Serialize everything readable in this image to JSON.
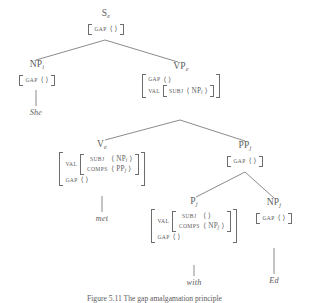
{
  "figure": {
    "caption": "Figure 5.11  The gap amalgamation principle"
  },
  "symbols": {
    "empty_list": "⟨ ⟩",
    "angle_open": "⟨",
    "angle_close": "⟩"
  },
  "tree": {
    "nodes": {
      "s": {
        "label": "S",
        "index": "e",
        "avm": {
          "rows": [
            {
              "attr": "GAP",
              "value": "⟨ ⟩"
            }
          ]
        }
      },
      "np_subject": {
        "label": "NP",
        "index": "i",
        "avm": {
          "rows": [
            {
              "attr": "GAP",
              "value": "⟨ ⟩"
            }
          ]
        },
        "word": "She"
      },
      "vp": {
        "label": "VP",
        "index": "e",
        "avm": {
          "rows": [
            {
              "attr": "GAP",
              "value": "⟨ ⟩"
            },
            {
              "attr": "VAL",
              "nested_rows": [
                {
                  "attr": "SUBJ",
                  "value": "⟨ NP",
                  "sub": "i",
                  "value_tail": " ⟩"
                }
              ]
            }
          ]
        }
      },
      "v": {
        "label": "V",
        "index": "e",
        "avm": {
          "rows": [
            {
              "attr": "VAL",
              "nested_rows": [
                {
                  "attr": "SUBJ",
                  "value": "⟨ NP",
                  "sub": "i",
                  "value_tail": " ⟩"
                },
                {
                  "attr": "COMPS",
                  "value": "⟨ PP",
                  "sub": "j",
                  "value_tail": " ⟩"
                }
              ]
            },
            {
              "attr": "GAP",
              "value": "⟨ ⟩"
            }
          ]
        },
        "word": "met"
      },
      "pp": {
        "label": "PP",
        "index": "j",
        "avm": {
          "rows": [
            {
              "attr": "GAP",
              "value": "⟨ ⟩"
            }
          ]
        }
      },
      "p": {
        "label": "P",
        "index": "j",
        "avm": {
          "rows": [
            {
              "attr": "VAL",
              "nested_rows": [
                {
                  "attr": "SUBJ",
                  "value": "⟨ ⟩",
                  "sub": "",
                  "value_tail": ""
                },
                {
                  "attr": "COMPS",
                  "value": "⟨ NP",
                  "sub": "j",
                  "value_tail": " ⟩"
                }
              ]
            },
            {
              "attr": "GAP",
              "value": "⟨ ⟩"
            }
          ]
        },
        "word": "with"
      },
      "np_object": {
        "label": "NP",
        "index": "j",
        "avm": {
          "rows": [
            {
              "attr": "GAP",
              "value": "⟨ ⟩"
            }
          ]
        },
        "word": "Ed"
      }
    }
  },
  "colors": {
    "ink": "#5c5c5c",
    "line": "#6d6d6d",
    "background": "#ffffff"
  }
}
